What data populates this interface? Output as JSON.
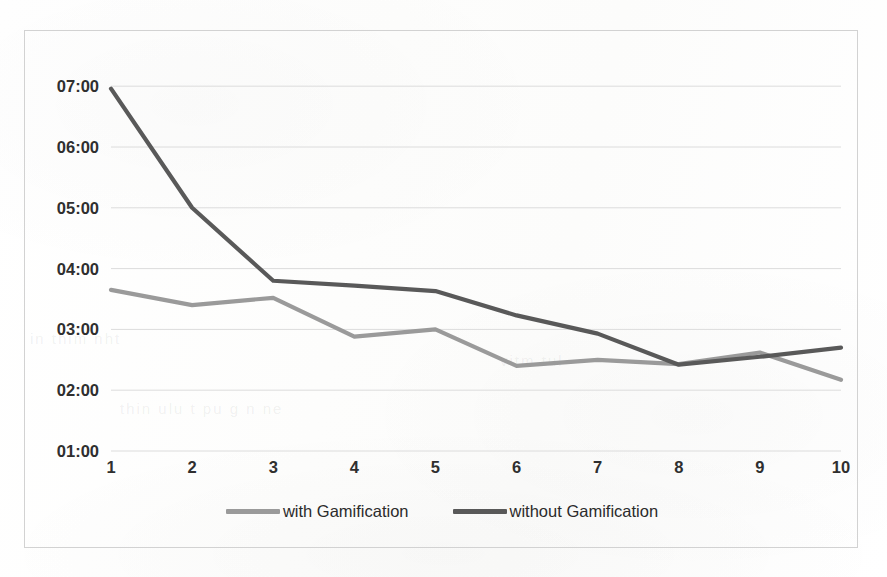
{
  "chart_data": {
    "type": "line",
    "title": "",
    "xlabel": "",
    "ylabel": "",
    "categories": [
      "1",
      "2",
      "3",
      "4",
      "5",
      "6",
      "7",
      "8",
      "9",
      "10"
    ],
    "x": [
      1,
      2,
      3,
      4,
      5,
      6,
      7,
      8,
      9,
      10
    ],
    "y_tick_labels": [
      "07:00",
      "06:00",
      "05:00",
      "04:00",
      "03:00",
      "02:00",
      "01:00"
    ],
    "y_tick_values": [
      7.0,
      6.0,
      5.0,
      4.0,
      3.0,
      2.0,
      1.0
    ],
    "ylim": [
      1.0,
      7.25
    ],
    "xlim": [
      1,
      10
    ],
    "grid": "horizontal",
    "legend_position": "bottom-center",
    "value_format": "mm:ss as hours:minutes",
    "series": [
      {
        "name": "with Gamification",
        "color": "#9a9a9a",
        "values": [
          3.65,
          3.4,
          3.52,
          2.88,
          3.0,
          2.4,
          2.5,
          2.43,
          2.62,
          2.17
        ],
        "labels": [
          "03:39",
          "03:24",
          "03:31",
          "02:53",
          "03:00",
          "02:24",
          "02:30",
          "02:26",
          "02:37",
          "02:10"
        ]
      },
      {
        "name": "without Gamification",
        "color": "#595959",
        "values": [
          6.96,
          5.0,
          3.8,
          3.72,
          3.63,
          3.23,
          2.93,
          2.42,
          2.55,
          2.7
        ],
        "labels": [
          "06:58",
          "05:00",
          "03:48",
          "03:43",
          "03:38",
          "03:14",
          "02:56",
          "02:25",
          "02:33",
          "02:42"
        ]
      }
    ]
  },
  "legend": {
    "entries": [
      {
        "label": "with Gamification"
      },
      {
        "label": "without Gamification"
      }
    ]
  },
  "colors": {
    "series_light": "#9a9a9a",
    "series_dark": "#595959",
    "gridline": "#dcdcdc",
    "border": "#d2d2d2",
    "tick_text": "#2f2f2f",
    "background": "#ffffff"
  }
}
